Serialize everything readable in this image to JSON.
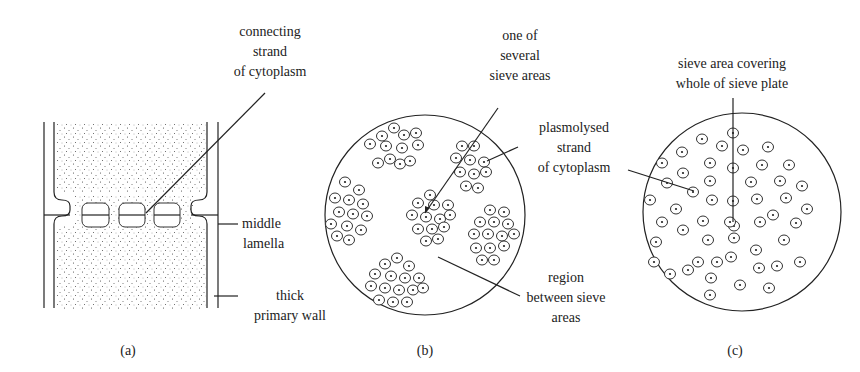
{
  "figure": {
    "panels": [
      {
        "id": "a",
        "caption": "(a)",
        "labels": {
          "connecting_strand": [
            "connecting",
            "strand",
            "of cytoplasm"
          ],
          "middle_lamella": [
            "middle",
            "lamella"
          ],
          "thick_primary_wall": [
            "thick",
            "primary wall"
          ]
        }
      },
      {
        "id": "b",
        "caption": "(b)",
        "labels": {
          "sieve_area": [
            "one of",
            "several",
            "sieve areas"
          ],
          "plasmolysed_strand": [
            "plasmolysed",
            "strand",
            "of cytoplasm"
          ],
          "region_between": [
            "region",
            "between sieve",
            "areas"
          ]
        }
      },
      {
        "id": "c",
        "caption": "(c)",
        "labels": {
          "sieve_area_whole": [
            "sieve area covering",
            "whole of sieve plate"
          ]
        }
      }
    ],
    "colors": {
      "ink": "#222222",
      "background": "#ffffff"
    }
  }
}
